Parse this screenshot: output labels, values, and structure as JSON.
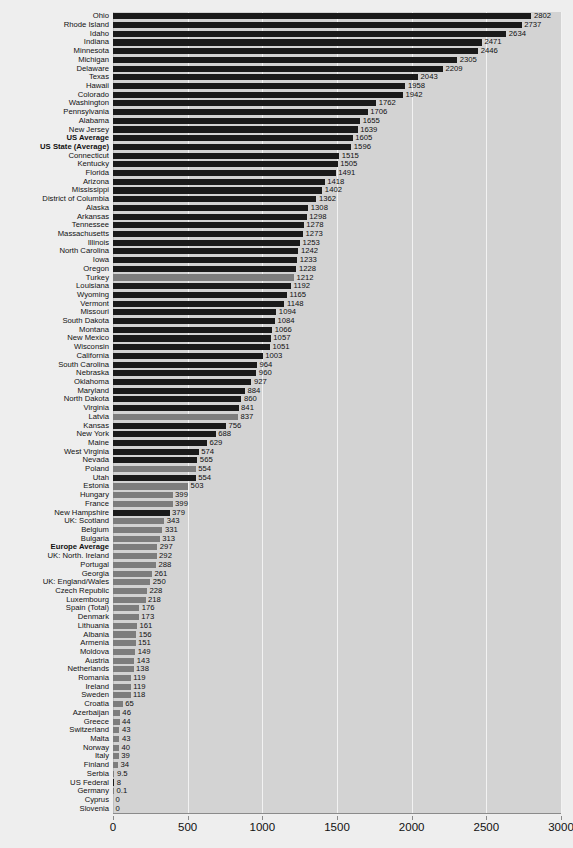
{
  "chart_data": {
    "type": "bar",
    "orientation": "horizontal",
    "title": "",
    "subtitle": "",
    "xlabel": "",
    "ylabel": "",
    "xlim": [
      0,
      3000
    ],
    "xticks": [
      0,
      500,
      1000,
      1500,
      2000,
      2500,
      3000
    ],
    "xtick_labels": [
      "0",
      "500",
      "1000",
      "1500",
      "2000",
      "2500",
      "3000"
    ],
    "grid": true,
    "grid_axis": "x",
    "legend": "none",
    "series_colors": {
      "us": "#1a1a1a",
      "europe": "#7d7d7d",
      "plot_background": "#d3d3d3",
      "figure_background": "#eeeeee",
      "gridline": "#f2f2f2",
      "axis": "#8a8a8a",
      "text": "#111111"
    },
    "categories": [
      "Ohio",
      "Rhode Island",
      "Idaho",
      "Indiana",
      "Minnesota",
      "Michigan",
      "Delaware",
      "Texas",
      "Hawaii",
      "Colorado",
      "Washington",
      "Pennsylvania",
      "Alabama",
      "New Jersey",
      "US Average",
      "US State (Average)",
      "Connecticut",
      "Kentucky",
      "Florida",
      "Arizona",
      "Mississippi",
      "District of Columbia",
      "Alaska",
      "Arkansas",
      "Tennessee",
      "Massachusetts",
      "Illinois",
      "North Carolina",
      "Iowa",
      "Oregon",
      "Turkey",
      "Louisiana",
      "Wyoming",
      "Vermont",
      "Missouri",
      "South Dakota",
      "Montana",
      "New Mexico",
      "Wisconsin",
      "California",
      "South Carolina",
      "Nebraska",
      "Oklahoma",
      "Maryland",
      "North Dakota",
      "Virginia",
      "Latvia",
      "Kansas",
      "New York",
      "Maine",
      "West Virginia",
      "Nevada",
      "Poland",
      "Utah",
      "Estonia",
      "Hungary",
      "France",
      "New Hampshire",
      "UK: Scotland",
      "Belgium",
      "Bulgaria",
      "Europe Average",
      "UK: North. Ireland",
      "Portugal",
      "Georgia",
      "UK: England/Wales",
      "Czech Republic",
      "Luxembourg",
      "Spain (Total)",
      "Denmark",
      "Lithuania",
      "Albania",
      "Armenia",
      "Moldova",
      "Austria",
      "Netherlands",
      "Romania",
      "Ireland",
      "Sweden",
      "Croatia",
      "Azerbaijan",
      "Greece",
      "Switzerland",
      "Malta",
      "Norway",
      "Italy",
      "Finland",
      "Serbia",
      "US Federal",
      "Germany",
      "Cyprus",
      "Slovenia"
    ],
    "values": [
      2802,
      2737,
      2634,
      2471,
      2446,
      2305,
      2209,
      2043,
      1958,
      1942,
      1762,
      1706,
      1655,
      1639,
      1605,
      1596,
      1515,
      1505,
      1491,
      1418,
      1402,
      1362,
      1308,
      1298,
      1278,
      1273,
      1253,
      1242,
      1233,
      1228,
      1212,
      1192,
      1165,
      1148,
      1094,
      1084,
      1066,
      1057,
      1051,
      1003,
      964,
      960,
      927,
      884,
      860,
      841,
      837,
      756,
      688,
      629,
      574,
      565,
      554,
      554,
      503,
      399,
      399,
      379,
      343,
      331,
      313,
      297,
      292,
      288,
      261,
      250,
      228,
      218,
      176,
      173,
      161,
      156,
      151,
      149,
      143,
      138,
      119,
      119,
      118,
      65,
      46,
      44,
      43,
      43,
      40,
      39,
      34,
      9.5,
      8,
      0.1,
      0,
      0
    ],
    "value_labels": [
      "2802",
      "2737",
      "2634",
      "2471",
      "2446",
      "2305",
      "2209",
      "2043",
      "1958",
      "1942",
      "1762",
      "1706",
      "1655",
      "1639",
      "1605",
      "1596",
      "1515",
      "1505",
      "1491",
      "1418",
      "1402",
      "1362",
      "1308",
      "1298",
      "1278",
      "1273",
      "1253",
      "1242",
      "1233",
      "1228",
      "1212",
      "1192",
      "1165",
      "1148",
      "1094",
      "1084",
      "1066",
      "1057",
      "1051",
      "1003",
      "964",
      "960",
      "927",
      "884",
      "860",
      "841",
      "837",
      "756",
      "688",
      "629",
      "574",
      "565",
      "554",
      "554",
      "503",
      "399",
      "399",
      "379",
      "343",
      "331",
      "313",
      "297",
      "292",
      "288",
      "261",
      "250",
      "228",
      "218",
      "176",
      "173",
      "161",
      "156",
      "151",
      "149",
      "143",
      "138",
      "119",
      "119",
      "118",
      "65",
      "46",
      "44",
      "43",
      "43",
      "40",
      "39",
      "34",
      "9.5",
      "8",
      "0.1",
      "0",
      "0"
    ],
    "groups": [
      "us",
      "us",
      "us",
      "us",
      "us",
      "us",
      "us",
      "us",
      "us",
      "us",
      "us",
      "us",
      "us",
      "us",
      "us",
      "us",
      "us",
      "us",
      "us",
      "us",
      "us",
      "us",
      "us",
      "us",
      "us",
      "us",
      "us",
      "us",
      "us",
      "us",
      "europe",
      "us",
      "us",
      "us",
      "us",
      "us",
      "us",
      "us",
      "us",
      "us",
      "us",
      "us",
      "us",
      "us",
      "us",
      "us",
      "europe",
      "us",
      "us",
      "us",
      "us",
      "us",
      "europe",
      "us",
      "europe",
      "europe",
      "europe",
      "us",
      "europe",
      "europe",
      "europe",
      "europe",
      "europe",
      "europe",
      "europe",
      "europe",
      "europe",
      "europe",
      "europe",
      "europe",
      "europe",
      "europe",
      "europe",
      "europe",
      "europe",
      "europe",
      "europe",
      "europe",
      "europe",
      "europe",
      "europe",
      "europe",
      "europe",
      "europe",
      "europe",
      "europe",
      "europe",
      "europe",
      "us",
      "europe",
      "europe",
      "europe"
    ],
    "emphasis": [
      "US Average",
      "US State (Average)",
      "Europe Average"
    ]
  }
}
